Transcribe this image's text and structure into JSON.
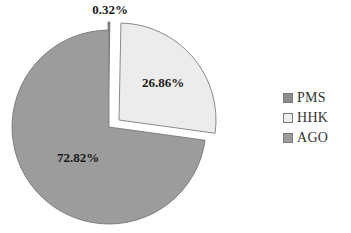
{
  "chart_data": {
    "type": "pie",
    "title": "",
    "categories": [
      "PMS",
      "HHK",
      "AGO"
    ],
    "values": [
      0.32,
      26.86,
      72.82
    ],
    "labels": [
      "0.32%",
      "26.86%",
      "72.82%"
    ],
    "colors": [
      "#8c8c8c",
      "#ececec",
      "#9c9c9c"
    ],
    "exploded": [
      "PMS",
      "HHK"
    ],
    "legend_position": "right"
  },
  "legend": {
    "items": [
      {
        "label": "PMS",
        "color": "#8c8c8c"
      },
      {
        "label": "HHK",
        "color": "#ececec"
      },
      {
        "label": "AGO",
        "color": "#9c9c9c"
      }
    ]
  }
}
